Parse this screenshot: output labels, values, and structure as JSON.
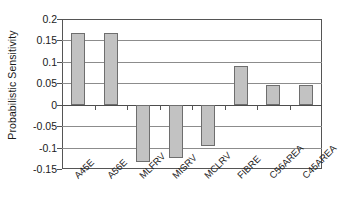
{
  "chart_data": {
    "type": "bar",
    "title": "",
    "xlabel": "",
    "ylabel": "Probabilistic Sensitivity",
    "categories": [
      "A45E",
      "A56E",
      "MLFRV",
      "MISRV",
      "MCLRV",
      "FIBRE",
      "C56AREA",
      "C45AREA"
    ],
    "values": [
      0.168,
      0.167,
      -0.133,
      -0.125,
      -0.097,
      0.09,
      0.045,
      0.045
    ],
    "ylim": [
      -0.15,
      0.2
    ],
    "ytick_values": [
      0.2,
      0.15,
      0.1,
      0.05,
      0,
      -0.05,
      -0.1,
      -0.15
    ],
    "ytick_labels": [
      "0.2",
      "0.15",
      "0.1",
      "0.05",
      "0",
      "-0.05",
      "-0.1",
      "-0.15"
    ],
    "grid": true,
    "legend": false,
    "legend_position": "none",
    "bar_color": "#c2c2c2",
    "bar_edge_color": "#6e6e6e",
    "gridline_color": "#8c8c8c",
    "axis_color": "#555555",
    "xtick_label_rotation": -45
  }
}
